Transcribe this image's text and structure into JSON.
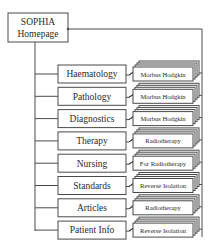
{
  "diagram": {
    "type": "hierarchy",
    "root": {
      "line1": "SOPHIA",
      "line2": "Homepage"
    },
    "sections": [
      {
        "label": "Haematology",
        "sub": "Morbus Hodgkin"
      },
      {
        "label": "Pathology",
        "sub": "Morbus Hodgkin"
      },
      {
        "label": "Diagnostics",
        "sub": "Morbus Hodgkin"
      },
      {
        "label": "Therapy",
        "sub": "Radiotherapy"
      },
      {
        "label": "Nursing",
        "sub": "For Radiotherapy"
      },
      {
        "label": "Standards",
        "sub": "Reverse Isolation"
      },
      {
        "label": "Articles",
        "sub": "Radiotherapy"
      },
      {
        "label": "Patient Info",
        "sub": "Reverse Isolation"
      }
    ],
    "colors": {
      "line": "#4a4a4a",
      "text": "#2a2a2a",
      "background": "#ffffff"
    }
  }
}
